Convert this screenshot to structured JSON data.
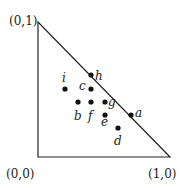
{
  "vertices": {
    "top": {
      "label": "(0,1)",
      "x": 38,
      "y": 22,
      "lx": 9,
      "ly": 25
    },
    "origin": {
      "label": "(0,0)",
      "x": 38,
      "y": 157,
      "lx": 6,
      "ly": 178
    },
    "right": {
      "label": "(1,0)",
      "x": 170,
      "y": 157,
      "lx": 148,
      "ly": 178
    }
  },
  "points": [
    {
      "name": "h",
      "x": 91,
      "y": 75,
      "lx": 95,
      "ly": 80
    },
    {
      "name": "i",
      "x": 65,
      "y": 89,
      "lx": 62,
      "ly": 82
    },
    {
      "name": "c",
      "x": 91,
      "y": 89,
      "lx": 79,
      "ly": 90
    },
    {
      "name": "b",
      "x": 78,
      "y": 102,
      "lx": 74,
      "ly": 120
    },
    {
      "name": "f",
      "x": 91,
      "y": 102,
      "lx": 88,
      "ly": 120
    },
    {
      "name": "g",
      "x": 105,
      "y": 102,
      "lx": 108,
      "ly": 106
    },
    {
      "name": "e",
      "x": 105,
      "y": 115,
      "lx": 101,
      "ly": 126
    },
    {
      "name": "a",
      "x": 131,
      "y": 115,
      "lx": 135,
      "ly": 117
    },
    {
      "name": "d",
      "x": 118,
      "y": 128,
      "lx": 114,
      "ly": 145
    }
  ],
  "colors": {
    "stroke": "#222222",
    "dot": "#111111"
  }
}
